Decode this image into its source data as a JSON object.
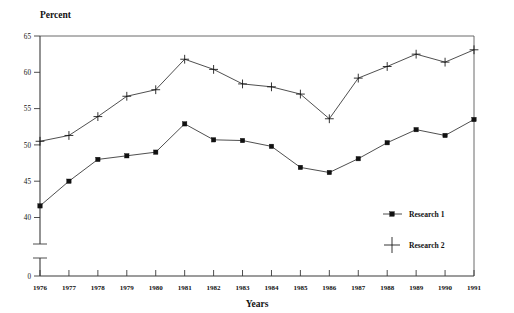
{
  "chart_data": {
    "type": "line",
    "title": "",
    "xlabel": "Years",
    "ylabel": "Percent",
    "categories": [
      "1976",
      "1977",
      "1978",
      "1979",
      "1980",
      "1981",
      "1982",
      "1983",
      "1984",
      "1985",
      "1986",
      "1987",
      "1988",
      "1989",
      "1990",
      "1991"
    ],
    "x": [
      1976,
      1977,
      1978,
      1979,
      1980,
      1981,
      1982,
      1983,
      1984,
      1985,
      1986,
      1987,
      1988,
      1989,
      1990,
      1991
    ],
    "series": [
      {
        "name": "Research 1",
        "marker": "filled-square",
        "color": "#111111",
        "values": [
          41.6,
          45.0,
          48.0,
          48.5,
          49.0,
          52.9,
          50.7,
          50.6,
          49.8,
          46.9,
          46.2,
          48.1,
          50.3,
          52.1,
          51.3,
          53.5
        ]
      },
      {
        "name": "Research 2",
        "marker": "plus",
        "color": "#111111",
        "values": [
          50.5,
          51.3,
          53.9,
          56.7,
          57.6,
          61.8,
          60.4,
          58.4,
          58.0,
          57.0,
          53.6,
          59.2,
          60.8,
          62.5,
          61.4,
          63.1
        ]
      }
    ],
    "ytick_labels": [
      "65",
      "60",
      "55",
      "50",
      "45",
      "40",
      "0"
    ],
    "ytick_values": [
      65,
      60,
      55,
      50,
      45,
      40,
      0
    ],
    "ylim": [
      40,
      65
    ],
    "axis_break": true,
    "axis_break_note": "y-axis broken between 0 and 40",
    "grid": false,
    "legend_position": "inside-lower-right",
    "legend_entries": [
      "Research 1",
      "Research 2"
    ]
  },
  "labels": {
    "y_axis_title": "Percent",
    "x_axis_title": "Years"
  },
  "legend": {
    "item1": "Research 1",
    "item2": "Research 2"
  }
}
